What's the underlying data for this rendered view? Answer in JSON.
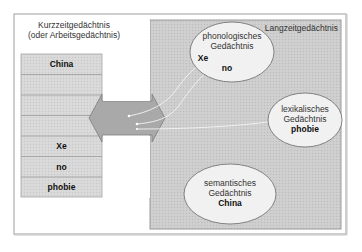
{
  "short_term": {
    "title_line1": "Kurzzeitgedächtnis",
    "title_line2": "(oder Arbeitsgedächtnis)",
    "slots": [
      "China",
      "",
      "",
      "",
      "Xe",
      "no",
      "phobie"
    ]
  },
  "long_term": {
    "title": "Langzeitgedächtnis",
    "phonological": {
      "line1": "phonologisches",
      "line2": "Gedächtnis",
      "item1": "Xe",
      "item2": "no"
    },
    "lexical": {
      "line1": "lexikalisches",
      "line2": "Gedächtnis",
      "item": "phobie"
    },
    "semantic": {
      "line1": "semantisches",
      "line2": "Gedächtnis",
      "item": "China"
    }
  },
  "colors": {
    "frame": "#9a9a9a",
    "stack_fill": "#d6d6d6",
    "longterm_fill": "#cfcfcf",
    "arrow_fill": "#a9a9a9",
    "ellipse_fill": "#f0f0f0"
  }
}
